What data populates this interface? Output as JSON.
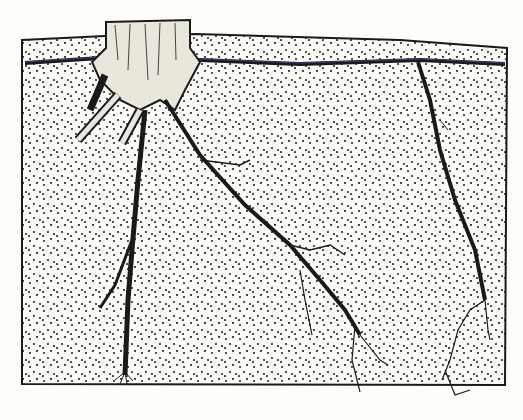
{
  "illustration": {
    "subject": "tree stump with root system in stippled soil cross-section",
    "colors": {
      "background": "#fdfdfa",
      "ink": "#1a1a1a",
      "stipple": "#2a2a2a",
      "shallow_root_tint": "#3b3b8a"
    }
  }
}
